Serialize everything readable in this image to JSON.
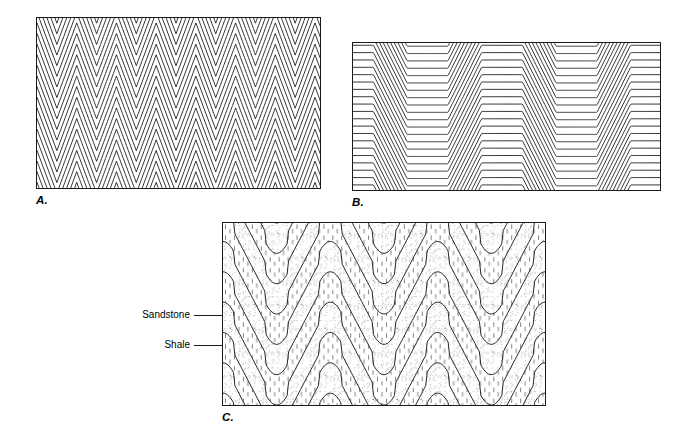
{
  "figure": {
    "domain": "diagram",
    "background_color": "#ffffff",
    "line_color": "#1a1a1a",
    "width": 685,
    "height": 445
  },
  "panels": [
    {
      "id": "a",
      "label": "A.",
      "fold_style": "chevron",
      "description": "Tight symmetrical chevron (zigzag) folds with uniform bed thickness and sharp angular hinges",
      "x": 36,
      "y": 17,
      "width": 285,
      "height": 172,
      "layer_count": 17,
      "wavelength": 40,
      "amplitude": 27,
      "limb_dip_degrees": 54,
      "hinge_radius": 0,
      "fill": "none"
    },
    {
      "id": "b",
      "label": "B.",
      "fold_style": "kink-box",
      "description": "Kink or box folds: long flat segments separated by short steeply inclined limbs, producing an offset staircase pattern",
      "x": 352,
      "y": 42,
      "width": 309,
      "height": 149,
      "layer_count": 21,
      "wavelength": 150,
      "amplitude": 34,
      "limb_dip_degrees": 45,
      "flat_fraction": 0.55,
      "fill": "none"
    },
    {
      "id": "c",
      "label": "C.",
      "fold_style": "chevron-with-lithology",
      "description": "Chevron folds in alternating sandstone and shale beds; hinges are rounded in the thicker competent beds and shale thickens into the fold cores",
      "x": 222,
      "y": 222,
      "width": 324,
      "height": 184,
      "layer_count": 9,
      "wavelength": 108,
      "amplitude": 52,
      "limb_dip_degrees": 50,
      "hinge_radius": 11,
      "fill": "lithology"
    }
  ],
  "lithologies": [
    {
      "key": "sandstone",
      "label": "Sandstone",
      "pattern": "stipple-dots",
      "pattern_description": "random fine stipple dots",
      "color": "#555555",
      "bed_relative_thickness": 1.0
    },
    {
      "key": "shale",
      "label": "Shale",
      "pattern": "vertical-dashes",
      "pattern_description": "short vertical dash ticks in rows",
      "color": "#555555",
      "bed_relative_thickness": 1.0
    }
  ],
  "annotations": [
    {
      "key": "sandstone",
      "text": "Sandstone",
      "leader_from_x": 194,
      "leader_to_x": 222,
      "leader_y": 315,
      "target_panel": "c"
    },
    {
      "key": "shale",
      "text": "Shale",
      "leader_from_x": 194,
      "leader_to_x": 222,
      "leader_y": 345,
      "target_panel": "c"
    }
  ]
}
